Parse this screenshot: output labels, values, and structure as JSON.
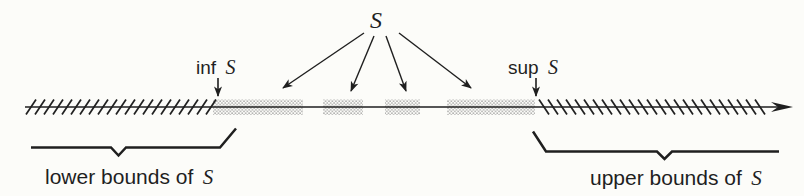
{
  "figure": {
    "annotations": {
      "set": {
        "symbol": "S"
      },
      "infimum": {
        "prefix": "inf",
        "symbol": "S"
      },
      "supremum": {
        "prefix": "sup",
        "symbol": "S"
      },
      "lower_bounds": {
        "prefix": "lower bounds of",
        "symbol": "S"
      },
      "upper_bounds": {
        "prefix": "upper bounds of",
        "symbol": "S"
      }
    },
    "colors": {
      "ink": "#1f1f1f",
      "stipple": "#8f8f8f",
      "paper": "#fcfcf9"
    },
    "geometry": {
      "line": {
        "y": 107,
        "x1": 25,
        "x2": 779
      },
      "hatch_left": {
        "x1": 31,
        "x2": 212,
        "step": 9,
        "half": 5,
        "rise": 7.5,
        "dir": "forward"
      },
      "hatch_right": {
        "x1": 544,
        "x2": 762,
        "step": 9,
        "half": 5,
        "rise": 7.5,
        "dir": "backward"
      },
      "stipple_segments": [
        [
          213,
          303
        ],
        [
          323,
          363
        ],
        [
          385,
          420
        ],
        [
          447,
          535
        ]
      ],
      "stipple_band": {
        "top": 99.5,
        "height": 15.5
      },
      "s_arrows": [
        [
          364,
          33,
          283,
          88
        ],
        [
          374,
          36,
          351,
          91
        ],
        [
          386,
          36,
          406,
          91
        ],
        [
          399,
          33,
          471,
          88
        ]
      ],
      "inf_arrow": [
        218,
        78,
        218,
        96
      ],
      "sup_arrow": [
        536,
        78,
        536,
        96
      ]
    }
  }
}
